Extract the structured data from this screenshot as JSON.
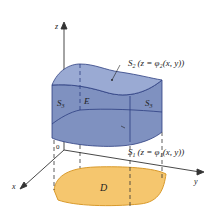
{
  "figure": {
    "type": "3d-region-between-surfaces",
    "axes": {
      "x": "x",
      "y": "y",
      "z": "z",
      "origin": "0"
    },
    "labels": {
      "top_surface_name": "S",
      "top_surface_sub": "2",
      "top_surface_eq": "(z = φ₂(x, y))",
      "bottom_surface_name": "S",
      "bottom_surface_sub": "1",
      "bottom_surface_eq": "(z = φ₁(x, y))",
      "side_left_name": "S",
      "side_left_sub": "3",
      "side_right_name": "S",
      "side_right_sub": "3",
      "solid": "E",
      "region": "D"
    },
    "colors": {
      "solid_fill": "#8a9cc8",
      "solid_top": "#9aa9d0",
      "solid_edge": "#2c3e80",
      "region_fill": "#f5c66e",
      "region_edge": "#d99a2b",
      "axis": "#333333"
    }
  }
}
